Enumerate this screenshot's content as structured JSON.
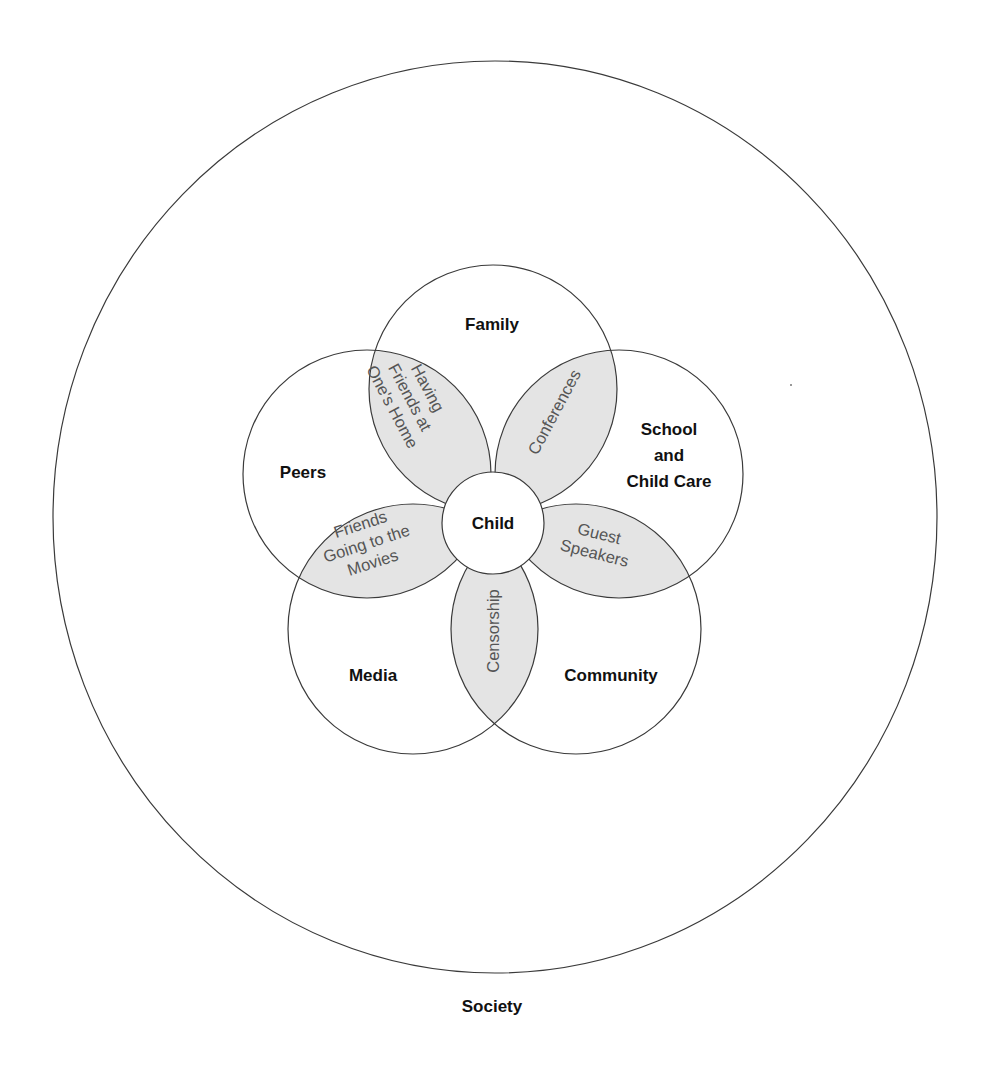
{
  "diagram": {
    "type": "nested-venn",
    "outer": {
      "label": "Society"
    },
    "center": {
      "label": "Child"
    },
    "spheres": [
      {
        "id": "family",
        "lines": [
          "Family"
        ]
      },
      {
        "id": "school",
        "lines": [
          "School",
          "and",
          "Child Care"
        ]
      },
      {
        "id": "community",
        "lines": [
          "Community"
        ]
      },
      {
        "id": "media",
        "lines": [
          "Media"
        ]
      },
      {
        "id": "peers",
        "lines": [
          "Peers"
        ]
      }
    ],
    "overlaps": [
      {
        "between": [
          "family",
          "peers"
        ],
        "lines": [
          "Having",
          "Friends at",
          "One's Home"
        ]
      },
      {
        "between": [
          "family",
          "school"
        ],
        "lines": [
          "Conferences"
        ]
      },
      {
        "between": [
          "school",
          "community"
        ],
        "lines": [
          "Guest",
          "Speakers"
        ]
      },
      {
        "between": [
          "community",
          "media"
        ],
        "lines": [
          "Censorship"
        ]
      },
      {
        "between": [
          "media",
          "peers"
        ],
        "lines": [
          "Friends",
          "Going to the",
          "Movies"
        ]
      }
    ],
    "colors": {
      "stroke": "#3a3a3a",
      "overlap_fill": "#e4e4e4",
      "overlap_text": "#555555",
      "label_text": "#111111",
      "background": "#ffffff"
    }
  }
}
